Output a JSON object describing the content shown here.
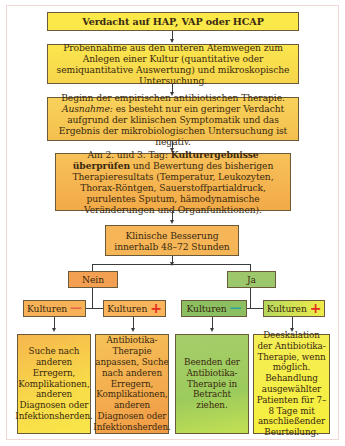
{
  "diagram": {
    "type": "flowchart",
    "colors": {
      "yellow": "#fbe94a",
      "amber": "#f3bf4e",
      "orange": "#f3a052",
      "green": "#9cc86b",
      "minus_sign_left": "#e7644a",
      "minus_sign_right": "#2fa39a",
      "plus_sign": "#e52d1e"
    },
    "nodes": {
      "start": {
        "text": "Verdacht auf HAP, VAP oder HCAP"
      },
      "sampling": {
        "text": "Probennahme aus den unteren Atemwegen zum Anlegen einer Kultur (quantitative oder semiquantitative Auswertung) und mikroskopische Untersuchung."
      },
      "therapy": {
        "line1": "Beginn der empirischen antibiotischen Therapie.",
        "exception_label": "Ausnahme:",
        "exception_text": " es besteht nur ein geringer Verdacht aufgrund der klinischen Symptomatik und das Ergebnis der mikrobiologischen Untersuchung ist negativ."
      },
      "review": {
        "prefix": "Am 2. und 3. Tag: ",
        "bold": "Kulturergebnisse überprüfen",
        "rest": " und Bewertung des bisherigen Therapieresultats (Temperatur, Leukozyten, Thorax-Röntgen, Sauerstoffpartialdruck, purulentes Sputum, hämodynamische Veränderungen und Organfunktionen)."
      },
      "improvement": {
        "line1": "Klinische Besserung",
        "line2": "innerhalb 48–72 Stunden"
      },
      "no": {
        "text": "Nein"
      },
      "yes": {
        "text": "Ja"
      },
      "no_culture_neg": {
        "label": "Kulturen",
        "sign": "—"
      },
      "no_culture_pos": {
        "label": "Kulturen",
        "sign": "+"
      },
      "yes_culture_neg": {
        "label": "Kulturen",
        "sign": "—"
      },
      "yes_culture_pos": {
        "label": "Kulturen",
        "sign": "+"
      },
      "outcome_1": {
        "text": "Suche nach anderen Erregern, Komplikationen, anderen Diagnosen oder Infektionsherden."
      },
      "outcome_2": {
        "text": "Antibiotika-Therapie anpassen, Suche nach anderen Erregern, Komplikationen, anderen Diagnosen oder Infektionsherden."
      },
      "outcome_3": {
        "text": "Beenden der Antibiotika-Therapie in Betracht ziehen."
      },
      "outcome_4": {
        "text": "Deeskalation der Antibiotika-Therapie, wenn möglich. Behandlung ausgewählter Patienten für 7–8 Tage mit anschließender Beurteilung."
      }
    }
  }
}
